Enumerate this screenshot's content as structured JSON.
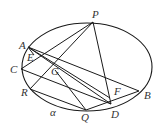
{
  "diagram": {
    "ellipse": {
      "cx": 87,
      "cy": 67,
      "rx": 65,
      "ry": 44
    },
    "points": {
      "P": {
        "x": 93,
        "y": 22,
        "lx": 92,
        "ly": 18
      },
      "A": {
        "x": 28,
        "y": 47,
        "lx": 19,
        "ly": 49
      },
      "E": {
        "x": 34,
        "y": 55,
        "lx": 27,
        "ly": 61
      },
      "C": {
        "x": 21,
        "y": 69,
        "lx": 10,
        "ly": 73
      },
      "G": {
        "x": 55,
        "y": 70,
        "lx": 51,
        "ly": 75
      },
      "R": {
        "x": 30,
        "y": 89,
        "lx": 21,
        "ly": 96
      },
      "Q": {
        "x": 86,
        "y": 110,
        "lx": 81,
        "ly": 121
      },
      "D": {
        "x": 111,
        "y": 104,
        "lx": 111,
        "ly": 118
      },
      "F": {
        "x": 110,
        "y": 98,
        "lx": 114,
        "ly": 95
      },
      "B": {
        "x": 139,
        "y": 91,
        "lx": 144,
        "ly": 99
      }
    },
    "labels": [
      "P",
      "A",
      "E",
      "C",
      "G",
      "R",
      "Q",
      "D",
      "F",
      "B"
    ],
    "plane_label": "α",
    "plane_label_pos": {
      "x": 50,
      "y": 116
    },
    "segments": [
      [
        "A",
        "B"
      ],
      [
        "A",
        "F"
      ],
      [
        "A",
        "D"
      ],
      [
        "C",
        "D"
      ],
      [
        "C",
        "P"
      ],
      [
        "R",
        "P"
      ],
      [
        "R",
        "Q"
      ],
      [
        "G",
        "Q"
      ],
      [
        "P",
        "D"
      ],
      [
        "Q",
        "B"
      ],
      [
        "A",
        "E"
      ]
    ],
    "stroke_color": "#1a1a1a"
  }
}
